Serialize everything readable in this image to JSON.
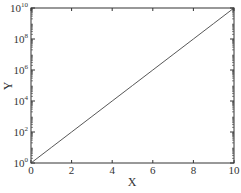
{
  "chart_data": {
    "type": "line",
    "title": "",
    "xlabel": "X",
    "ylabel": "Y",
    "xscale": "linear",
    "yscale": "log",
    "xlim": [
      0,
      10
    ],
    "ylim": [
      1,
      10000000000
    ],
    "grid": false,
    "legend": null,
    "x_ticks": [
      0,
      2,
      4,
      6,
      8,
      10
    ],
    "x_tick_labels": [
      "0",
      "2",
      "4",
      "6",
      "8",
      "10"
    ],
    "y_ticks": [
      1,
      100,
      10000,
      1000000,
      100000000,
      10000000000
    ],
    "y_tick_labels": [
      {
        "base": "10",
        "exp": "0"
      },
      {
        "base": "10",
        "exp": "2"
      },
      {
        "base": "10",
        "exp": "4"
      },
      {
        "base": "10",
        "exp": "6"
      },
      {
        "base": "10",
        "exp": "8"
      },
      {
        "base": "10",
        "exp": "10"
      }
    ],
    "series": [
      {
        "name": "y = 10^x",
        "color": "#444444",
        "x": [
          0,
          1,
          2,
          3,
          4,
          5,
          6,
          7,
          8,
          9,
          10
        ],
        "y": [
          1,
          10,
          100,
          1000,
          10000,
          100000,
          1000000,
          10000000,
          100000000,
          1000000000,
          10000000000
        ]
      }
    ]
  },
  "style": {
    "axis_color": "#333333",
    "line_color": "#444444",
    "background": "#ffffff"
  }
}
